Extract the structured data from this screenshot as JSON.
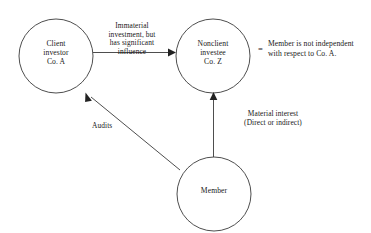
{
  "diagram": {
    "background_color": "#ffffff",
    "stroke_color": "#3a3a3a",
    "text_color": "#171717",
    "nodes": [
      {
        "id": "client-investor",
        "label": "Client\ninvestor\nCo. A",
        "shape": "circle",
        "cx": 56,
        "cy": 56,
        "r": 37
      },
      {
        "id": "nonclient-investee",
        "label": "Nonclient\ninvestee\nCo. Z",
        "shape": "circle",
        "cx": 213,
        "cy": 56,
        "r": 37
      },
      {
        "id": "member",
        "label": "Member",
        "shape": "circle",
        "cx": 214,
        "cy": 194,
        "r": 37
      }
    ],
    "edges": [
      {
        "id": "influence-edge",
        "from": "client-investor",
        "to": "nonclient-investee",
        "label": "Immaterial\ninvestment, but\nhas significant\ninfluence",
        "arrow": "to"
      },
      {
        "id": "audits-edge",
        "from": "member",
        "to": "client-investor",
        "label": "Audits",
        "arrow": "to"
      },
      {
        "id": "material-interest-edge",
        "from": "member",
        "to": "nonclient-investee",
        "label": "Material interest\n(Direct or indirect)",
        "arrow": "to"
      }
    ],
    "conclusion": {
      "equals_sign": "=",
      "text": "Member is not independent\nwith respect to Co. A."
    }
  }
}
